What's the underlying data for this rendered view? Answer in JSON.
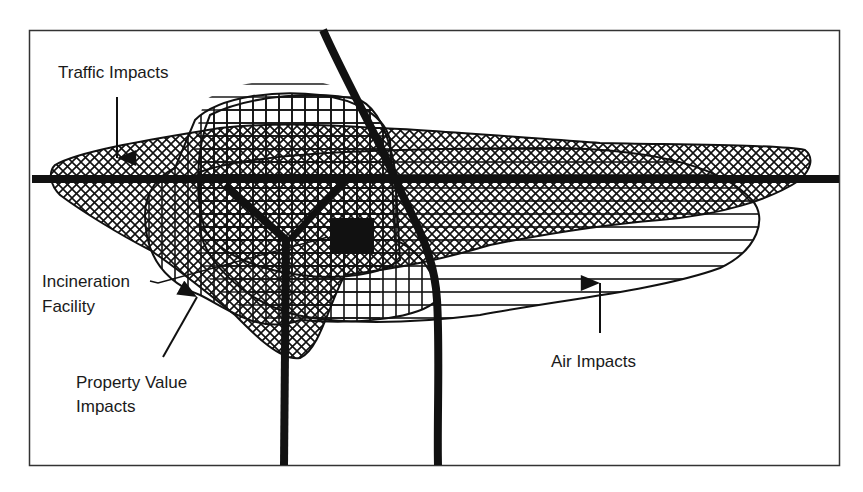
{
  "diagram": {
    "type": "impact-zones-map",
    "frame": {
      "border_color": "#333333",
      "background": "#ffffff"
    },
    "facility": {
      "label": "Incineration\nFacility",
      "line1": "Incineration",
      "line2": "Facility",
      "color": "#111111"
    },
    "zones": [
      {
        "id": "traffic",
        "label": "Traffic Impacts",
        "pattern": "crosshatch-diagonal"
      },
      {
        "id": "property",
        "label_line1": "Property Value",
        "label_line2": "Impacts",
        "label": "Property Value Impacts",
        "pattern": "vertical-lines"
      },
      {
        "id": "air",
        "label": "Air Impacts",
        "pattern": "horizontal-lines"
      }
    ],
    "roads": {
      "color": "#111111",
      "count": 4
    }
  },
  "labels": {
    "traffic": "Traffic Impacts",
    "incineration_line1": "Incineration",
    "incineration_line2": "Facility",
    "property_line1": "Property Value",
    "property_line2": "Impacts",
    "air": "Air Impacts"
  }
}
